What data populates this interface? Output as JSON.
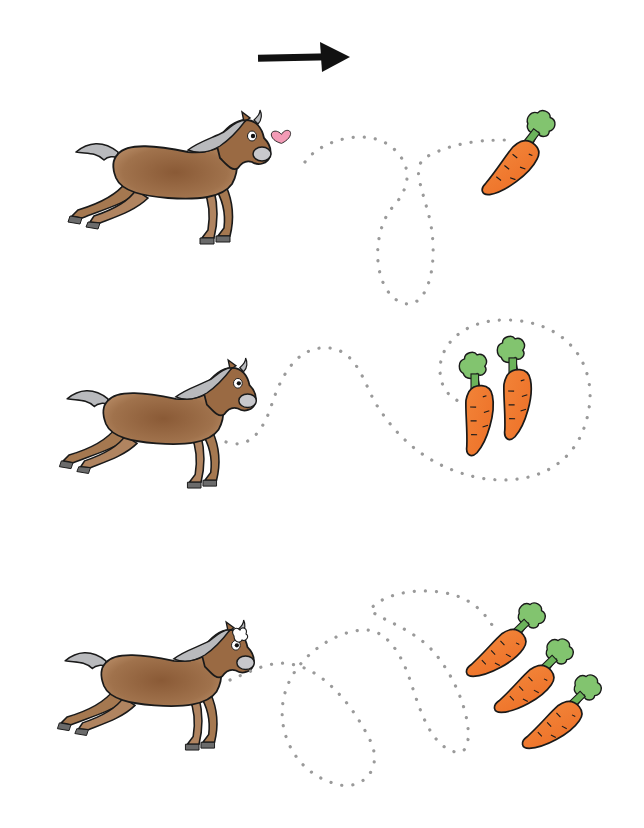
{
  "worksheet": {
    "title": "Trace the path from each horse to the carrots",
    "direction_arrow": "right-arrow-icon",
    "colors": {
      "background": "#ffffff",
      "arrow": "#111111",
      "dots": "#9a9a9a",
      "horse_body": "#9a6a43",
      "horse_mane": "#b9babd",
      "carrot": "#f07a2e",
      "carrot_leaves": "#7cc06a",
      "heart": "#f39bb6",
      "outline": "#1a1a1a"
    },
    "rows": [
      {
        "id": 1,
        "horse": "horse-with-heart",
        "carrot_count": 1,
        "path": "loop"
      },
      {
        "id": 2,
        "horse": "horse-trotting",
        "carrot_count": 2,
        "path": "wave-around"
      },
      {
        "id": 3,
        "horse": "horse-puffing",
        "carrot_count": 3,
        "path": "double-loop"
      }
    ]
  }
}
